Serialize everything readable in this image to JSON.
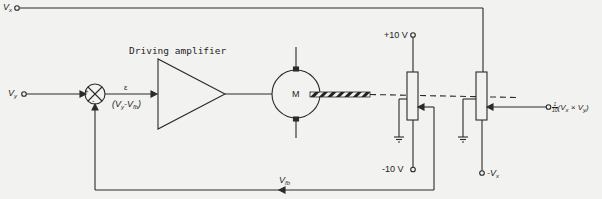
{
  "diagram": {
    "type": "block-diagram",
    "labels": {
      "vx_input": "V",
      "vx_input_sub": "x",
      "vy_input": "V",
      "vy_input_sub": "y",
      "summing_plus": "+",
      "summing_minus": "-",
      "error_symbol": "ε",
      "error_expr_open": "(V",
      "error_expr_sub1": "y",
      "error_expr_mid": "-V",
      "error_expr_sub2": "fb",
      "error_expr_close": ")",
      "amplifier": "Driving amplifier",
      "motor": "M",
      "plus_ref": "+10 V",
      "minus_ref": "-10 V",
      "neg_vx": "-V",
      "neg_vx_sub": "x",
      "feedback": "V",
      "feedback_sub": "fb",
      "output_frac_num": "1",
      "output_frac_den": "10",
      "output_expr_open": "(V",
      "output_expr_sub1": "x",
      "output_expr_mid": " × V",
      "output_expr_sub2": "y",
      "output_expr_close": ")"
    },
    "nodes": [
      {
        "id": "vx_in",
        "label": "Vx",
        "kind": "input-terminal"
      },
      {
        "id": "vy_in",
        "label": "Vy",
        "kind": "input-terminal"
      },
      {
        "id": "sum",
        "label": "summing junction (+ Vy, - Vfb)",
        "kind": "summer"
      },
      {
        "id": "amp",
        "label": "Driving amplifier",
        "kind": "amplifier"
      },
      {
        "id": "motor",
        "label": "M",
        "kind": "motor"
      },
      {
        "id": "pot_fb",
        "label": "feedback potentiometer (+10 V / -10 V)",
        "kind": "potentiometer"
      },
      {
        "id": "pot_mult",
        "label": "multiplier potentiometer (Vx / -Vx)",
        "kind": "potentiometer"
      },
      {
        "id": "out",
        "label": "1/10 (Vx × Vy)",
        "kind": "output-terminal"
      }
    ],
    "edges": [
      {
        "from": "vy_in",
        "to": "sum"
      },
      {
        "from": "sum",
        "to": "amp",
        "label": "ε = (Vy - Vfb)"
      },
      {
        "from": "amp",
        "to": "motor"
      },
      {
        "from": "motor",
        "to": "pot_fb",
        "label": "mechanical shaft"
      },
      {
        "from": "motor",
        "to": "pot_mult",
        "label": "mechanical shaft"
      },
      {
        "from": "pot_fb",
        "to": "sum",
        "label": "Vfb"
      },
      {
        "from": "vx_in",
        "to": "pot_mult"
      },
      {
        "from": "pot_mult",
        "to": "out"
      }
    ],
    "colors": {
      "ink": "#2a2a2a",
      "paper": "#f2f2f0"
    }
  }
}
